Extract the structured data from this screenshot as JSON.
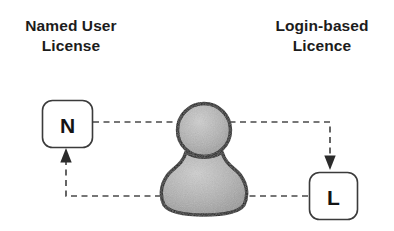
{
  "diagram": {
    "title_left": {
      "line1": "Named User",
      "line2": "License"
    },
    "title_right": {
      "line1": "Login-based",
      "line2": "Licence"
    },
    "nodes": [
      {
        "id": "named-user-node",
        "label": "N"
      },
      {
        "id": "login-based-node",
        "label": "L"
      }
    ],
    "actor": {
      "name": "user-person-icon",
      "label": ""
    },
    "connectors": [
      {
        "name": "named-user-to-login-based",
        "from": "N",
        "to": "L",
        "style": "dashed",
        "direction": "forward"
      },
      {
        "name": "login-based-to-named-user",
        "from": "L",
        "to": "N",
        "style": "dashed",
        "direction": "forward"
      }
    ],
    "colors": {
      "background": "#ffffff",
      "text": "#1c1c1c",
      "box_border": "#3b3b3b",
      "connector": "#4a4a4a",
      "person_outline": "#0d0d0d",
      "person_fill": "#a8a8a8"
    }
  }
}
